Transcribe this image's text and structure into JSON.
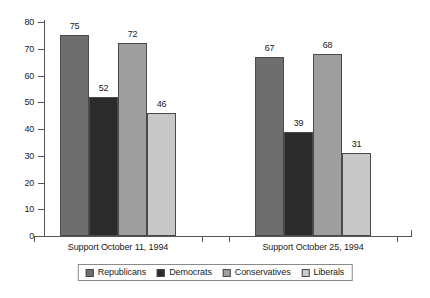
{
  "chart_data": {
    "type": "bar",
    "title": "",
    "subtitle": "",
    "xlabel": "",
    "ylabel": "",
    "ylim": [
      0,
      80
    ],
    "yticks": [
      0,
      10,
      20,
      30,
      40,
      50,
      60,
      70,
      80
    ],
    "ytick_labels": [
      "0",
      "10",
      "20",
      "30",
      "40",
      "50",
      "60",
      "70",
      "80"
    ],
    "grid": false,
    "legend_position": "bottom",
    "categories": [
      "Support October 11, 1994",
      "Support October 25, 1994"
    ],
    "series": [
      {
        "name": "Republicans",
        "values": [
          75,
          67
        ],
        "color": "#6e6e6e"
      },
      {
        "name": "Democrats",
        "values": [
          52,
          39
        ],
        "color": "#2b2b2b"
      },
      {
        "name": "Conservatives",
        "values": [
          72,
          68
        ],
        "color": "#9e9e9e"
      },
      {
        "name": "Liberals",
        "values": [
          46,
          31
        ],
        "color": "#c8c8c8"
      }
    ],
    "data_labels": [
      {
        "series": "Republicans",
        "category": "Support October 11, 1994",
        "value": "75"
      },
      {
        "series": "Democrats",
        "category": "Support October 11, 1994",
        "value": "52"
      },
      {
        "series": "Conservatives",
        "category": "Support October 11, 1994",
        "value": "72"
      },
      {
        "series": "Liberals",
        "category": "Support October 11, 1994",
        "value": "46"
      },
      {
        "series": "Republicans",
        "category": "Support October 25, 1994",
        "value": "67"
      },
      {
        "series": "Democrats",
        "category": "Support October 25, 1994",
        "value": "39"
      },
      {
        "series": "Conservatives",
        "category": "Support October 25, 1994",
        "value": "68"
      },
      {
        "series": "Liberals",
        "category": "Support October 25, 1994",
        "value": "31"
      }
    ]
  },
  "legend": {
    "items": [
      {
        "label": "Republicans",
        "color": "#6e6e6e"
      },
      {
        "label": "Democrats",
        "color": "#2b2b2b"
      },
      {
        "label": "Conservatives",
        "color": "#9e9e9e"
      },
      {
        "label": "Liberals",
        "color": "#c8c8c8"
      }
    ]
  },
  "axis": {
    "y_labels": [
      "80",
      "70",
      "60",
      "50",
      "40",
      "30",
      "20",
      "10",
      "0"
    ],
    "x_labels": [
      "Support October 11, 1994",
      "Support October 25, 1994"
    ]
  }
}
